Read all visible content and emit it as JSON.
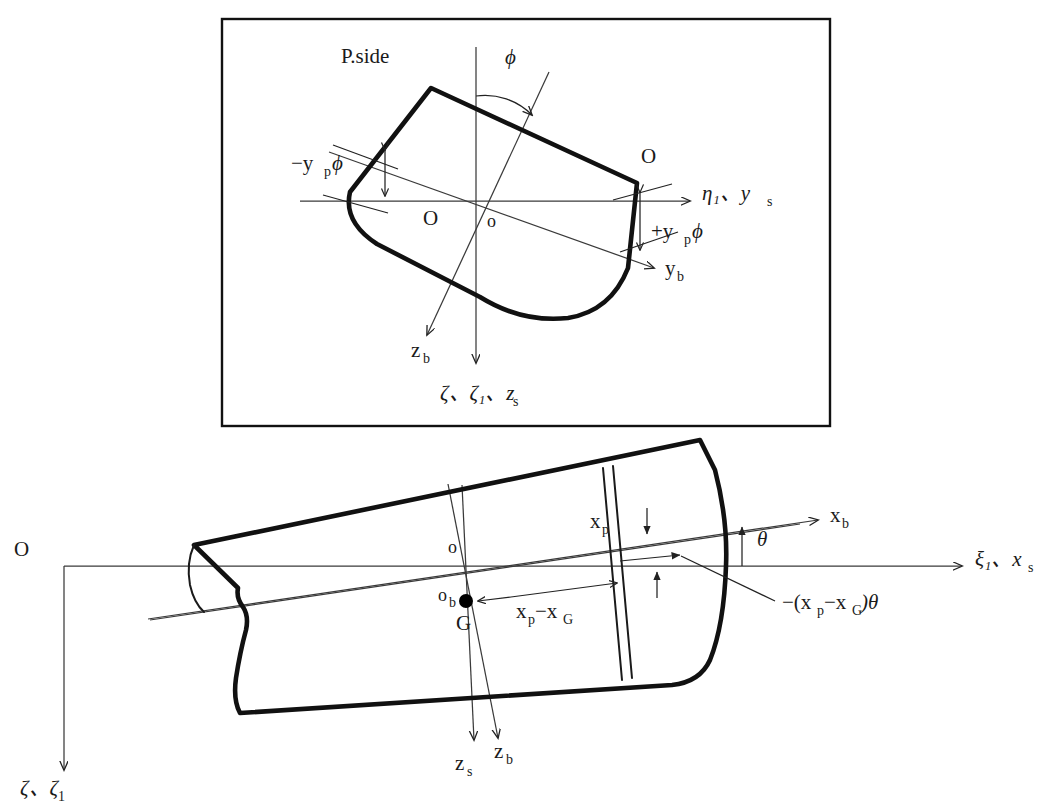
{
  "figure": {
    "type": "technical-diagram",
    "background_color": "#ffffff",
    "line_color": "#111111",
    "thin_line_color": "#3a3a3a"
  },
  "panels": [
    {
      "id": "upper",
      "name": "transverse-section-roll",
      "has_border": true,
      "border_rect": {
        "x": 222,
        "y": 19,
        "w": 608,
        "h": 407
      },
      "labels": {
        "port_side": "P.side",
        "starboard_side": "S.side",
        "roll_angle": "ϕ",
        "origin_space_fixed": "O",
        "origin_body_fixed": "o",
        "lateral_axis": "η₁、y",
        "lateral_axis_sub": "s",
        "body_lateral_axis": "y",
        "body_lateral_axis_sub": "b",
        "body_vertical_axis": "z",
        "body_vertical_axis_sub": "b",
        "vertical_axis": "ζ、ζ₁、z",
        "vertical_axis_sub": "s",
        "displacement_port": "−y",
        "displacement_port_sub": "p",
        "displacement_port_tail": "ϕ",
        "displacement_stbd": "+y",
        "displacement_stbd_sub": "p",
        "displacement_stbd_tail": "ϕ"
      }
    },
    {
      "id": "lower",
      "name": "longitudinal-profile-pitch",
      "has_border": false,
      "labels": {
        "origin_space_fixed": "O",
        "origin_body_fixed": "o",
        "origin_baseline": "o",
        "origin_baseline_sub": "b",
        "center_of_gravity": "G",
        "longitudinal_axis": "ξ₁、x",
        "longitudinal_axis_sub": "s",
        "body_longitudinal_axis": "x",
        "body_longitudinal_axis_sub": "b",
        "pitch_angle": "θ",
        "section_position": "x",
        "section_position_sub": "p",
        "distance_from_G": "x",
        "distance_from_G_sub1": "p",
        "distance_from_G_mid": "−x",
        "distance_from_G_sub2": "G",
        "vertical_displacement": "−(x",
        "vertical_displacement_sub1": "p",
        "vertical_displacement_mid": "−x",
        "vertical_displacement_sub2": "G",
        "vertical_displacement_tail": ")θ",
        "vertical_axis": "ζ、ζ",
        "vertical_axis_sub": "1",
        "ship_vertical_axis": "z",
        "ship_vertical_axis_sub": "s",
        "body_vertical_axis": "z",
        "body_vertical_axis_sub": "b"
      }
    }
  ]
}
